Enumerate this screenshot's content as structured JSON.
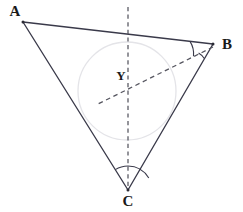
{
  "figure": {
    "type": "geometry-diagram",
    "width": 243,
    "height": 212,
    "background_color": "#ffffff"
  },
  "colors": {
    "side_stroke": "#3a3a4a",
    "dashed_stroke": "#4a4a55",
    "circle_stroke": "#e2e2e6",
    "arc_stroke": "#3a3a4a",
    "label_fill": "#1a1a1a"
  },
  "points": [
    {
      "id": "A",
      "label": "A",
      "x": 23,
      "y": 22,
      "label_x": 15,
      "label_y": 13,
      "kind": "vertex"
    },
    {
      "id": "B",
      "label": "B",
      "x": 213,
      "y": 44,
      "label_x": 227,
      "label_y": 46,
      "kind": "vertex"
    },
    {
      "id": "C",
      "label": "C",
      "x": 128,
      "y": 190,
      "label_x": 128,
      "label_y": 203,
      "kind": "vertex"
    },
    {
      "id": "Y",
      "label": "Y",
      "x": 127,
      "y": 91,
      "label_x": 121,
      "label_y": 77,
      "kind": "incenter"
    }
  ],
  "sides": [
    {
      "id": "AB",
      "from": "A",
      "to": "B",
      "x1": 23,
      "y1": 22,
      "x2": 213,
      "y2": 44,
      "style": "solid"
    },
    {
      "id": "BC",
      "from": "B",
      "to": "C",
      "x1": 213,
      "y1": 44,
      "x2": 128,
      "y2": 190,
      "style": "solid"
    },
    {
      "id": "CA",
      "from": "C",
      "to": "A",
      "x1": 128,
      "y1": 190,
      "x2": 23,
      "y2": 22,
      "style": "solid"
    }
  ],
  "bisectors": [
    {
      "id": "bisector-from-C",
      "label": "angle bisector from C",
      "x1": 128,
      "y1": 7,
      "x2": 128,
      "y2": 190,
      "style": "dashed",
      "orientation": "vertical"
    },
    {
      "id": "bisector-from-B",
      "label": "angle bisector from B",
      "x1": 213,
      "y1": 47,
      "x2": 96,
      "y2": 105,
      "style": "dashed",
      "orientation": "oblique"
    }
  ],
  "incircle": {
    "id": "incircle",
    "center_x": 127,
    "center_y": 91,
    "radius": 49,
    "style": "solid",
    "fill": "none"
  },
  "angle_marks": [
    {
      "id": "arc-B-upper",
      "vertex": "B",
      "radius": 23,
      "start_deg": 186,
      "end_deg": 212,
      "note": "between side BA and bisector BY"
    },
    {
      "id": "arc-B-lower",
      "vertex": "B",
      "radius": 17,
      "start_deg": 212,
      "end_deg": 240,
      "note": "between bisector BY and side BC"
    },
    {
      "id": "arc-C-left",
      "vertex": "C",
      "radius": 24,
      "start_deg": 238,
      "end_deg": 270,
      "note": "between side CA and bisector CY"
    },
    {
      "id": "arc-C-right",
      "vertex": "C",
      "radius": 24,
      "start_deg": 270,
      "end_deg": 300,
      "note": "between bisector CY and side CB"
    }
  ],
  "caption": ""
}
